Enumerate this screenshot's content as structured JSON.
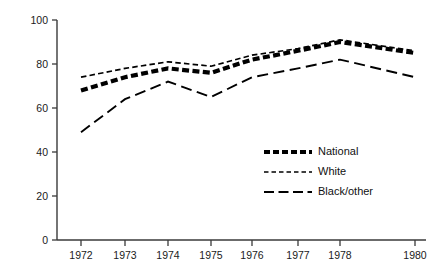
{
  "chart_data": {
    "type": "line",
    "title": "",
    "subtitle": "",
    "xlabel": "",
    "ylabel": "",
    "x": [
      "1972",
      "1973",
      "1974",
      "1975",
      "1976",
      "1977",
      "1978",
      "1980"
    ],
    "categories": [
      "1972",
      "1973",
      "1974",
      "1975",
      "1976",
      "1977",
      "1978",
      "1980"
    ],
    "xtick_labels": [
      "1972",
      "1973",
      "1974",
      "1975",
      "1976",
      "1977",
      "1978",
      "1980"
    ],
    "ytick_labels": [
      "0",
      "20",
      "40",
      "60",
      "80",
      "100"
    ],
    "yticks": [
      0,
      20,
      40,
      60,
      80,
      100
    ],
    "ylim": [
      0,
      100
    ],
    "grid": false,
    "legend_position": "center-right",
    "series": [
      {
        "name": "National",
        "style": "thick-dashed",
        "color": "#000000",
        "values": [
          68,
          74,
          78,
          76,
          82,
          86,
          90,
          85
        ]
      },
      {
        "name": "White",
        "style": "fine-dotted",
        "color": "#000000",
        "values": [
          74,
          78,
          81,
          79,
          84,
          87,
          91,
          86
        ]
      },
      {
        "name": "Black/other",
        "style": "long-dashed",
        "color": "#000000",
        "values": [
          49,
          64,
          72,
          65,
          74,
          78,
          82,
          74
        ]
      }
    ]
  },
  "legend": {
    "items": [
      {
        "label": "National"
      },
      {
        "label": "White"
      },
      {
        "label": "Black/other"
      }
    ]
  },
  "colors": {
    "ink": "#000000",
    "axis": "#3a3a3a",
    "background": "#ffffff"
  }
}
